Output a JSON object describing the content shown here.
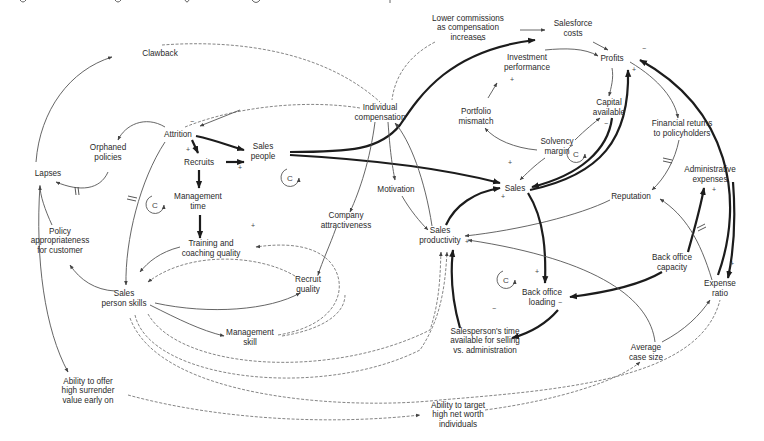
{
  "diagram": {
    "type": "causal-loop-diagram",
    "header_fragment": "(partial line of text cropped at top edge)",
    "nodes": [
      {
        "id": "clawback",
        "label": [
          "Clawback"
        ],
        "x": 160,
        "y": 53
      },
      {
        "id": "lower_comm",
        "label": [
          "Lower commissions",
          "as compensation",
          "increases"
        ],
        "x": 468,
        "y": 27
      },
      {
        "id": "salesforce_costs",
        "label": [
          "Salesforce",
          "costs"
        ],
        "x": 573,
        "y": 28
      },
      {
        "id": "profits",
        "label": [
          "Profits"
        ],
        "x": 612,
        "y": 58
      },
      {
        "id": "investment_perf",
        "label": [
          "Investment",
          "performance"
        ],
        "x": 527,
        "y": 62
      },
      {
        "id": "portfolio_mismatch",
        "label": [
          "Portfolio",
          "mismatch"
        ],
        "x": 476,
        "y": 116
      },
      {
        "id": "capital_available",
        "label": [
          "Capital",
          "available"
        ],
        "x": 609,
        "y": 107
      },
      {
        "id": "individual_comp",
        "label": [
          "Individual",
          "compensation"
        ],
        "x": 380,
        "y": 112
      },
      {
        "id": "attrition",
        "label": [
          "Attrition"
        ],
        "x": 178,
        "y": 134
      },
      {
        "id": "orphaned_policies",
        "label": [
          "Orphaned",
          "policies"
        ],
        "x": 108,
        "y": 152
      },
      {
        "id": "recruits",
        "label": [
          "Recruits"
        ],
        "x": 199,
        "y": 162
      },
      {
        "id": "sales_people",
        "label": [
          "Sales",
          "people"
        ],
        "x": 263,
        "y": 151
      },
      {
        "id": "solvency_margin",
        "label": [
          "Solvency",
          "margin"
        ],
        "x": 557,
        "y": 146
      },
      {
        "id": "financial_returns",
        "label": [
          "Financial returns",
          "to policyholders"
        ],
        "x": 682,
        "y": 128
      },
      {
        "id": "lapses",
        "label": [
          "Lapses"
        ],
        "x": 48,
        "y": 173
      },
      {
        "id": "motivation",
        "label": [
          "Motivation"
        ],
        "x": 396,
        "y": 189
      },
      {
        "id": "sales",
        "label": [
          "Sales"
        ],
        "x": 515,
        "y": 188
      },
      {
        "id": "admin_expenses",
        "label": [
          "Administrative",
          "expenses"
        ],
        "x": 710,
        "y": 174
      },
      {
        "id": "management_time",
        "label": [
          "Management",
          "time"
        ],
        "x": 198,
        "y": 201
      },
      {
        "id": "company_attr",
        "label": [
          "Company",
          "attractiveness"
        ],
        "x": 346,
        "y": 220
      },
      {
        "id": "reputation",
        "label": [
          "Reputation"
        ],
        "x": 631,
        "y": 196
      },
      {
        "id": "policy_approp",
        "label": [
          "Policy",
          "appropriateness",
          "for customer"
        ],
        "x": 60,
        "y": 240
      },
      {
        "id": "training_quality",
        "label": [
          "Training and",
          "coaching quality"
        ],
        "x": 211,
        "y": 248
      },
      {
        "id": "sales_productivity",
        "label": [
          "Sales",
          "productivity"
        ],
        "x": 440,
        "y": 235
      },
      {
        "id": "recruit_quality",
        "label": [
          "Recruit",
          "quality"
        ],
        "x": 308,
        "y": 284
      },
      {
        "id": "back_office_capacity",
        "label": [
          "Back office",
          "capacity"
        ],
        "x": 672,
        "y": 262
      },
      {
        "id": "expense_ratio",
        "label": [
          "Expense",
          "ratio"
        ],
        "x": 720,
        "y": 288
      },
      {
        "id": "salesperson_skills",
        "label": [
          "Sales",
          "person skills"
        ],
        "x": 124,
        "y": 298
      },
      {
        "id": "back_office_loading",
        "label": [
          "Back office",
          "loading"
        ],
        "x": 542,
        "y": 297
      },
      {
        "id": "management_skill",
        "label": [
          "Management",
          "skill"
        ],
        "x": 250,
        "y": 337
      },
      {
        "id": "salesperson_time",
        "label": [
          "Salesperson's time",
          "available for selling",
          "vs. administration"
        ],
        "x": 485,
        "y": 340
      },
      {
        "id": "average_case_size",
        "label": [
          "Average",
          "case size"
        ],
        "x": 646,
        "y": 352
      },
      {
        "id": "ability_surrender",
        "label": [
          "Ability to offer",
          "high surrender",
          "value early on"
        ],
        "x": 88,
        "y": 390
      },
      {
        "id": "ability_target",
        "label": [
          "Ability to target",
          "high net worth",
          "individuals"
        ],
        "x": 458,
        "y": 414
      }
    ],
    "loop_markers": [
      {
        "letter": "C",
        "x": 155,
        "y": 205
      },
      {
        "letter": "C",
        "x": 290,
        "y": 178
      },
      {
        "letter": "C",
        "x": 576,
        "y": 154
      },
      {
        "letter": "C",
        "x": 506,
        "y": 280
      }
    ],
    "signs": [
      {
        "t": "+",
        "x": 479,
        "y": 42
      },
      {
        "t": "−",
        "x": 642,
        "y": 51
      },
      {
        "t": "+",
        "x": 632,
        "y": 72
      },
      {
        "t": "+",
        "x": 510,
        "y": 82
      },
      {
        "t": "−",
        "x": 190,
        "y": 124
      },
      {
        "t": "+",
        "x": 186,
        "y": 152
      },
      {
        "t": "+",
        "x": 238,
        "y": 170
      },
      {
        "t": "+",
        "x": 508,
        "y": 165
      },
      {
        "t": "+",
        "x": 501,
        "y": 199
      },
      {
        "t": "−",
        "x": 604,
        "y": 126
      },
      {
        "t": "+",
        "x": 712,
        "y": 192
      },
      {
        "t": "+",
        "x": 251,
        "y": 228
      },
      {
        "t": "+",
        "x": 465,
        "y": 244
      },
      {
        "t": "+",
        "x": 535,
        "y": 274
      },
      {
        "t": "−",
        "x": 558,
        "y": 305
      },
      {
        "t": "−",
        "x": 492,
        "y": 311
      },
      {
        "t": "+",
        "x": 730,
        "y": 266
      }
    ]
  }
}
